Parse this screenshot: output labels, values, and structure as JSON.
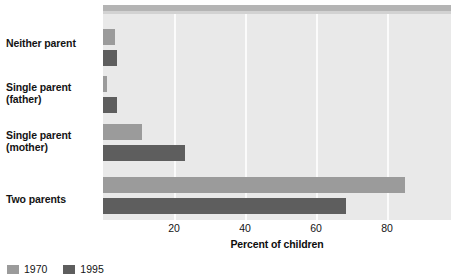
{
  "chart_data": {
    "type": "bar",
    "orientation": "horizontal",
    "title": "",
    "xlabel": "Percent of children",
    "ylabel": "",
    "categories": [
      "Neither parent",
      "Single parent (father)",
      "Single parent (mother)",
      "Two parents"
    ],
    "category_labels": [
      {
        "line1": "Neither parent",
        "line2": ""
      },
      {
        "line1": "Single parent",
        "line2": "(father)"
      },
      {
        "line1": "Single parent",
        "line2": "(mother)"
      },
      {
        "line1": "Two parents",
        "line2": ""
      }
    ],
    "series": [
      {
        "name": "1970",
        "color": "#9b9b9b",
        "values": [
          3.5,
          1.0,
          11.0,
          85.0
        ]
      },
      {
        "name": "1995",
        "color": "#5e5e5e",
        "values": [
          4.0,
          4.0,
          23.0,
          68.5
        ]
      }
    ],
    "xticks": [
      20,
      40,
      60,
      80
    ],
    "xtick_labels": [
      "20",
      "40",
      "60",
      "80"
    ],
    "xlim": [
      0,
      98
    ],
    "grid": true,
    "legend_position": "bottom-left",
    "plot_background": "#e9e9e9",
    "gridline_color": "#fbfbfb"
  },
  "legend": {
    "items": [
      {
        "label": "1970",
        "color": "#9b9b9b"
      },
      {
        "label": "1995",
        "color": "#5e5e5e"
      }
    ]
  },
  "axis": {
    "x_title": "Percent of children",
    "ticks": [
      "20",
      "40",
      "60",
      "80"
    ]
  }
}
